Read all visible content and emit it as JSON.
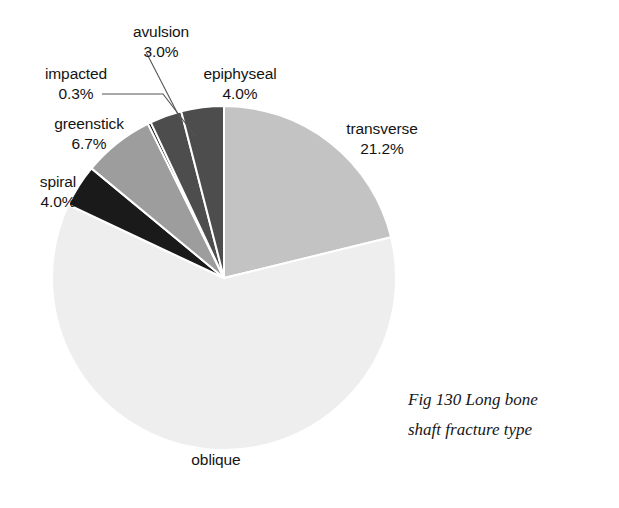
{
  "figure": {
    "caption_line_1": "Fig 130  Long bone",
    "caption_line_2": "shaft fracture type"
  },
  "labels": {
    "transverse": {
      "name": "transverse",
      "percent": "21.2%"
    },
    "oblique": {
      "name": "oblique",
      "percent": ""
    },
    "spiral": {
      "name": "spiral",
      "percent": "4.0%"
    },
    "greenstick": {
      "name": "greenstick",
      "percent": "6.7%"
    },
    "impacted": {
      "name": "impacted",
      "percent": "0.3%"
    },
    "avulsion": {
      "name": "avulsion",
      "percent": "3.0%"
    },
    "epiphyseal": {
      "name": "epiphyseal",
      "percent": "4.0%"
    }
  },
  "chart_data": {
    "type": "pie",
    "title": "Fig 130  Long bone shaft fracture type",
    "xlabel": "",
    "ylabel": "",
    "legend": "none",
    "grid": false,
    "value_unit": "percent",
    "start_angle_deg": 0,
    "direction": "clockwise",
    "center_px": [
      224,
      278
    ],
    "radius_px": 172,
    "slice_separator_color": "#ffffff",
    "categories": [
      "transverse",
      "oblique",
      "spiral",
      "greenstick",
      "impacted",
      "avulsion",
      "epiphyseal"
    ],
    "values": [
      21.2,
      60.8,
      4.0,
      6.7,
      0.3,
      3.0,
      4.0
    ],
    "labels": [
      "21.2%",
      "",
      "4.0%",
      "6.7%",
      "0.3%",
      "3.0%",
      "4.0%"
    ],
    "colors": [
      "#c3c3c3",
      "#eeeeee",
      "#1a1a1a",
      "#9d9d9d",
      "#0d0d0d",
      "#4d4d4d",
      "#4d4d4d"
    ],
    "slices": [
      {
        "label": "transverse",
        "value": 21.2,
        "display": "21.2%",
        "color": "#c3c3c3"
      },
      {
        "label": "oblique",
        "value": 60.8,
        "display": "",
        "color": "#eeeeee"
      },
      {
        "label": "spiral",
        "value": 4.0,
        "display": "4.0%",
        "color": "#1a1a1a"
      },
      {
        "label": "greenstick",
        "value": 6.7,
        "display": "6.7%",
        "color": "#9d9d9d"
      },
      {
        "label": "impacted",
        "value": 0.3,
        "display": "0.3%",
        "color": "#0d0d0d"
      },
      {
        "label": "avulsion",
        "value": 3.0,
        "display": "3.0%",
        "color": "#4d4d4d"
      },
      {
        "label": "epiphyseal",
        "value": 4.0,
        "display": "4.0%",
        "color": "#4d4d4d"
      }
    ]
  },
  "colors": {
    "background": "#ffffff",
    "text": "#141414",
    "leader_line": "#555555"
  }
}
